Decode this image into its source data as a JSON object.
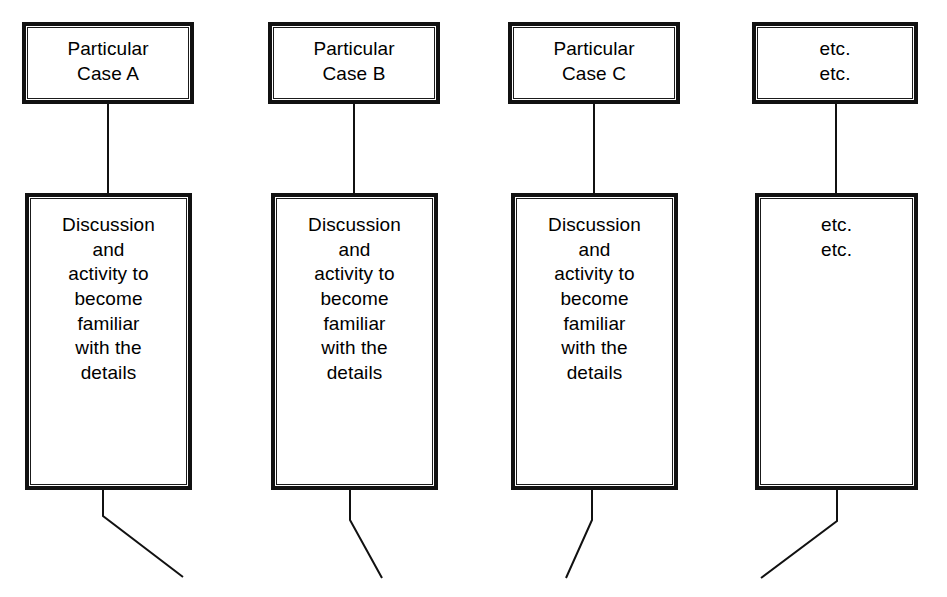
{
  "diagram": {
    "type": "flow-diagram",
    "background_color": "#ffffff",
    "line_color": "#111111",
    "text_color": "#000000",
    "columns": [
      {
        "id": "case-a",
        "top_box": {
          "label": "Particular\nCase A",
          "x": 22,
          "y": 22,
          "width": 172,
          "height": 82
        },
        "detail_box": {
          "label": "Discussion\nand\nactivity to\nbecome\nfamiliar\nwith the\ndetails",
          "x": 25,
          "y": 193,
          "width": 167,
          "height": 297
        },
        "connector": {
          "from_x": 108,
          "from_y": 104,
          "to_x": 108,
          "to_y": 193
        },
        "tail": {
          "stub_x": 103,
          "stub_top_y": 490,
          "stub_bottom_y": 516,
          "end_x": 183,
          "end_y": 577
        }
      },
      {
        "id": "case-b",
        "top_box": {
          "label": "Particular\nCase B",
          "x": 268,
          "y": 22,
          "width": 172,
          "height": 82
        },
        "detail_box": {
          "label": "Discussion\nand\nactivity to\nbecome\nfamiliar\nwith the\ndetails",
          "x": 271,
          "y": 193,
          "width": 167,
          "height": 297
        },
        "connector": {
          "from_x": 354,
          "from_y": 104,
          "to_x": 354,
          "to_y": 193
        },
        "tail": {
          "stub_x": 350,
          "stub_top_y": 490,
          "stub_bottom_y": 520,
          "end_x": 382,
          "end_y": 578
        }
      },
      {
        "id": "case-c",
        "top_box": {
          "label": "Particular\nCase C",
          "x": 508,
          "y": 22,
          "width": 172,
          "height": 82
        },
        "detail_box": {
          "label": "Discussion\nand\nactivity to\nbecome\nfamiliar\nwith the\ndetails",
          "x": 511,
          "y": 193,
          "width": 167,
          "height": 297
        },
        "connector": {
          "from_x": 594,
          "from_y": 104,
          "to_x": 594,
          "to_y": 193
        },
        "tail": {
          "stub_x": 592,
          "stub_top_y": 490,
          "stub_bottom_y": 520,
          "end_x": 566,
          "end_y": 578
        }
      },
      {
        "id": "etc",
        "top_box": {
          "label": "etc.\netc.",
          "x": 752,
          "y": 22,
          "width": 166,
          "height": 82
        },
        "detail_box": {
          "label": "etc.\netc.",
          "x": 755,
          "y": 193,
          "width": 163,
          "height": 297
        },
        "connector": {
          "from_x": 836,
          "from_y": 104,
          "to_x": 836,
          "to_y": 193
        },
        "tail": {
          "stub_x": 837,
          "stub_top_y": 490,
          "stub_bottom_y": 521,
          "end_x": 761,
          "end_y": 578
        }
      }
    ]
  }
}
